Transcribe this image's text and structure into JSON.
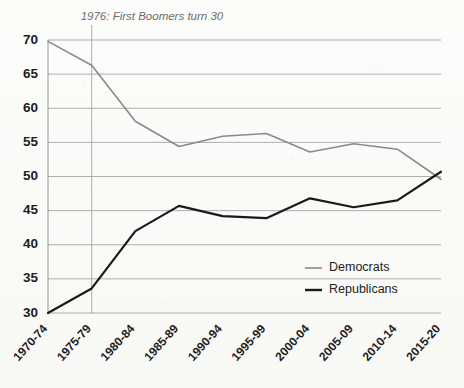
{
  "chart_data": {
    "type": "line",
    "title": "",
    "subtitle": "",
    "xlabel": "",
    "ylabel": "",
    "categories": [
      "1970-74",
      "1975-79",
      "1980-84",
      "1985-89",
      "1990-94",
      "1995-99",
      "2000-04",
      "2005-09",
      "2010-14",
      "2015-20"
    ],
    "series": [
      {
        "name": "Democrats",
        "color": "#8a8a8a",
        "values": [
          69.8,
          66.3,
          58.1,
          54.4,
          55.9,
          56.3,
          53.6,
          54.8,
          54.0,
          49.6
        ]
      },
      {
        "name": "Republicans",
        "color": "#1a1a1a",
        "values": [
          30.0,
          33.6,
          42.0,
          45.7,
          44.2,
          43.9,
          46.8,
          45.5,
          46.5,
          50.7
        ]
      }
    ],
    "ylim": [
      30,
      70
    ],
    "yticks": [
      30,
      35,
      40,
      45,
      50,
      55,
      60,
      65,
      70
    ],
    "ytick_labels": [
      "30",
      "35",
      "40",
      "45",
      "50",
      "55",
      "60",
      "65",
      "70"
    ],
    "grid": true,
    "grid_axis": "y",
    "legend_position": "inside-lower-right",
    "annotations": [
      {
        "text": "1976: First Boomers turn 30",
        "category": "1975-79",
        "style": "vertical-rule-with-label"
      }
    ]
  },
  "legend": {
    "entries": [
      {
        "label": "Democrats"
      },
      {
        "label": "Republicans"
      }
    ]
  },
  "colors": {
    "democrats": "#8a8a8a",
    "republicans": "#1a1a1a",
    "gridline": "#9a9a9a",
    "annotation_text": "#6d6d6d",
    "tick_text": "#1d1d1d",
    "background": "#fbfbf9"
  }
}
